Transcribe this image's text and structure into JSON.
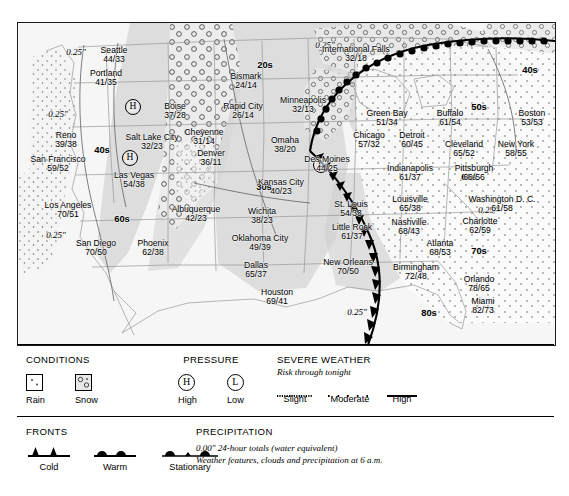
{
  "map": {
    "cities": [
      {
        "name": "Seattle",
        "temps": "44/33",
        "x": 96,
        "y": 23
      },
      {
        "name": "Portland",
        "temps": "41/35",
        "x": 88,
        "y": 46
      },
      {
        "name": "Reno",
        "temps": "39/38",
        "x": 48,
        "y": 108
      },
      {
        "name": "San Francisco",
        "temps": "59/52",
        "x": 40,
        "y": 132,
        "two": true
      },
      {
        "name": "Los Angeles",
        "temps": "70/51",
        "x": 50,
        "y": 178
      },
      {
        "name": "San Diego",
        "temps": "70/50",
        "x": 78,
        "y": 216
      },
      {
        "name": "Phoenix",
        "temps": "62/38",
        "x": 135,
        "y": 216
      },
      {
        "name": "Las Vegas",
        "temps": "54/38",
        "x": 116,
        "y": 148,
        "two": true
      },
      {
        "name": "Salt Lake City",
        "temps": "32/23",
        "x": 134,
        "y": 110
      },
      {
        "name": "Boise",
        "temps": "37/28",
        "x": 157,
        "y": 79
      },
      {
        "name": "Cheyenne",
        "temps": "31/14",
        "x": 186,
        "y": 105
      },
      {
        "name": "Denver",
        "temps": "36/11",
        "x": 193,
        "y": 126
      },
      {
        "name": "Albuquerque",
        "temps": "42/23",
        "x": 178,
        "y": 182
      },
      {
        "name": "Bismark",
        "temps": "24/14",
        "x": 228,
        "y": 49
      },
      {
        "name": "Rapid City",
        "temps": "26/14",
        "x": 225,
        "y": 79
      },
      {
        "name": "International Falls",
        "temps": "32/18",
        "x": 338,
        "y": 22
      },
      {
        "name": "Minneapolis",
        "temps": "32/13",
        "x": 285,
        "y": 73
      },
      {
        "name": "Omaha",
        "temps": "38/20",
        "x": 267,
        "y": 113
      },
      {
        "name": "Des Moines",
        "temps": "44/25",
        "x": 309,
        "y": 132
      },
      {
        "name": "Kansas City",
        "temps": "40/23",
        "x": 263,
        "y": 155
      },
      {
        "name": "Wichita",
        "temps": "38/23",
        "x": 244,
        "y": 184
      },
      {
        "name": "Oklahoma City",
        "temps": "49/39",
        "x": 242,
        "y": 211
      },
      {
        "name": "Dallas",
        "temps": "65/37",
        "x": 238,
        "y": 238
      },
      {
        "name": "Houston",
        "temps": "69/41",
        "x": 259,
        "y": 265
      },
      {
        "name": "St. Louis",
        "temps": "54/33",
        "x": 333,
        "y": 177
      },
      {
        "name": "Little Rock",
        "temps": "61/37",
        "x": 334,
        "y": 200
      },
      {
        "name": "New Orleans",
        "temps": "70/50",
        "x": 330,
        "y": 235,
        "two": true
      },
      {
        "name": "Green Bay",
        "temps": "51/34",
        "x": 369,
        "y": 86
      },
      {
        "name": "Chicago",
        "temps": "57/32",
        "x": 351,
        "y": 108
      },
      {
        "name": "Detroit",
        "temps": "60/45",
        "x": 394,
        "y": 108
      },
      {
        "name": "Indianapolis",
        "temps": "61/37",
        "x": 392,
        "y": 141
      },
      {
        "name": "Louisville",
        "temps": "65/38",
        "x": 392,
        "y": 172
      },
      {
        "name": "Nashville",
        "temps": "68/43",
        "x": 391,
        "y": 195
      },
      {
        "name": "Birmingham",
        "temps": "72/48",
        "x": 398,
        "y": 240
      },
      {
        "name": "Atlanta",
        "temps": "68/53",
        "x": 422,
        "y": 216
      },
      {
        "name": "Orlando",
        "temps": "78/65",
        "x": 461,
        "y": 252
      },
      {
        "name": "Miami",
        "temps": "82/73",
        "x": 465,
        "y": 274
      },
      {
        "name": "Charlotte",
        "temps": "62/59",
        "x": 462,
        "y": 194
      },
      {
        "name": "Washington D. C.",
        "temps": "61/58",
        "x": 484,
        "y": 172
      },
      {
        "name": "Pittsburgh",
        "temps": "66/56",
        "x": 456,
        "y": 141
      },
      {
        "name": "Cleveland",
        "temps": "65/52",
        "x": 446,
        "y": 117
      },
      {
        "name": "Buffalo",
        "temps": "61/54",
        "x": 432,
        "y": 86
      },
      {
        "name": "New York",
        "temps": "58/55",
        "x": 498,
        "y": 117
      },
      {
        "name": "Boston",
        "temps": "53/53",
        "x": 514,
        "y": 86
      }
    ],
    "bands": [
      {
        "label": "40s",
        "x": 84,
        "y": 121
      },
      {
        "label": "60s",
        "x": 104,
        "y": 190
      },
      {
        "label": "30s",
        "x": 246,
        "y": 158
      },
      {
        "label": "20s",
        "x": 247,
        "y": 36
      },
      {
        "label": "40s",
        "x": 512,
        "y": 41
      },
      {
        "label": "50s",
        "x": 461,
        "y": 78
      },
      {
        "label": "60s",
        "x": 451,
        "y": 148
      },
      {
        "label": "70s",
        "x": 461,
        "y": 222
      },
      {
        "label": "80s",
        "x": 411,
        "y": 284
      }
    ],
    "precip_labels": [
      {
        "text": "0.25\"",
        "x": 58,
        "y": 24
      },
      {
        "text": "0.25\"",
        "x": 40,
        "y": 86
      },
      {
        "text": "0.25\"",
        "x": 38,
        "y": 207
      },
      {
        "text": "0.25\"",
        "x": 307,
        "y": 17
      },
      {
        "text": "0.25\"",
        "x": 339,
        "y": 284
      },
      {
        "text": "0.25\"",
        "x": 470,
        "y": 182
      }
    ],
    "pressure_marks": [
      {
        "type": "H",
        "x": 115,
        "y": 84
      },
      {
        "type": "H",
        "x": 112,
        "y": 135
      },
      {
        "type": "L",
        "x": 303,
        "y": 142
      }
    ]
  },
  "legend": {
    "conditions": {
      "title": "CONDITIONS",
      "items": [
        {
          "label": "Rain",
          "icon": "rain-swatch"
        },
        {
          "label": "Snow",
          "icon": "snow-swatch"
        }
      ]
    },
    "pressure": {
      "title": "PRESSURE",
      "items": [
        {
          "symbol": "H",
          "label": "High"
        },
        {
          "symbol": "L",
          "label": "Low"
        }
      ]
    },
    "severe": {
      "title": "SEVERE WEATHER",
      "subtitle": "Risk through tonight",
      "items": [
        {
          "label": "Slight",
          "style": "fine-dotted"
        },
        {
          "label": "Moderate",
          "style": "spaced-dots"
        },
        {
          "label": "High",
          "style": "solid"
        }
      ]
    },
    "fronts": {
      "title": "FRONTS",
      "items": [
        {
          "label": "Cold",
          "icon": "cold-front-symbol"
        },
        {
          "label": "Warm",
          "icon": "warm-front-symbol"
        },
        {
          "label": "Stationary",
          "icon": "stationary-front-symbol"
        }
      ]
    },
    "precipitation": {
      "title": "PRECIPITATION",
      "line1": "0.00\" 24-hour totals (water equivalent)",
      "line2": "Weather features, clouds and precipitation at 6 a.m."
    }
  }
}
